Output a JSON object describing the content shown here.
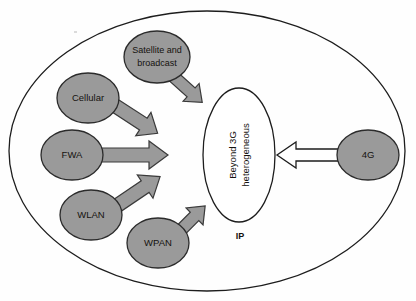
{
  "diagram": {
    "colors": {
      "node_fill": "#9a9a9a",
      "node_stroke": "#2b2b2b",
      "arrow_fill": "#9a9a9a",
      "arrow_stroke": "#3a3a3a",
      "white_arrow_fill": "#ffffff",
      "white_arrow_stroke": "#1d1d1d",
      "outer_stroke": "#1d1d1d",
      "center_fill": "#ffffff",
      "center_stroke": "#1d1d1d",
      "text": "#15120f",
      "background": "#fefefe"
    },
    "outer_boundary": {
      "name": "ip-network-boundary",
      "shape": "ellipse",
      "cx": 207,
      "cy": 151,
      "rx": 198,
      "ry": 140
    },
    "boundary_label": "IP",
    "center_node": {
      "name": "beyond-3g-heterogeneous",
      "line1": "Beyond 3G",
      "line2": "heterogeneous",
      "cx": 239,
      "cy": 155,
      "rx": 36,
      "ry": 67,
      "rotation": -90
    },
    "nodes": [
      {
        "id": "satellite",
        "label_line1": "Satellite and",
        "label_line2": "broadcast",
        "cx": 157,
        "cy": 57,
        "rx": 33,
        "ry": 26
      },
      {
        "id": "cellular",
        "label_line1": "Cellular",
        "label_line2": "",
        "cx": 88,
        "cy": 98,
        "rx": 31,
        "ry": 25
      },
      {
        "id": "fwa",
        "label_line1": "FWA",
        "label_line2": "",
        "cx": 72,
        "cy": 155,
        "rx": 31,
        "ry": 25
      },
      {
        "id": "wlan",
        "label_line1": "WLAN",
        "label_line2": "",
        "cx": 91,
        "cy": 215,
        "rx": 31,
        "ry": 25
      },
      {
        "id": "wpan",
        "label_line1": "WPAN",
        "label_line2": "",
        "cx": 158,
        "cy": 243,
        "rx": 31,
        "ry": 25
      },
      {
        "id": "4g",
        "label_line1": "4G",
        "label_line2": "",
        "cx": 368,
        "cy": 155,
        "rx": 31,
        "ry": 25
      }
    ],
    "arrows": [
      {
        "id": "satellite-to-center",
        "from": "satellite",
        "to": "center",
        "style": "filled-gray",
        "direction": "down-right"
      },
      {
        "id": "cellular-to-center",
        "from": "cellular",
        "to": "center",
        "style": "filled-gray",
        "direction": "down-right"
      },
      {
        "id": "fwa-to-center",
        "from": "fwa",
        "to": "center",
        "style": "filled-gray",
        "direction": "right"
      },
      {
        "id": "wlan-to-center",
        "from": "wlan",
        "to": "center",
        "style": "filled-gray",
        "direction": "up-right"
      },
      {
        "id": "wpan-to-center",
        "from": "wpan",
        "to": "center",
        "style": "filled-gray",
        "direction": "up-right"
      },
      {
        "id": "4g-to-center",
        "from": "4g",
        "to": "center",
        "style": "outlined-white",
        "direction": "left"
      }
    ]
  }
}
